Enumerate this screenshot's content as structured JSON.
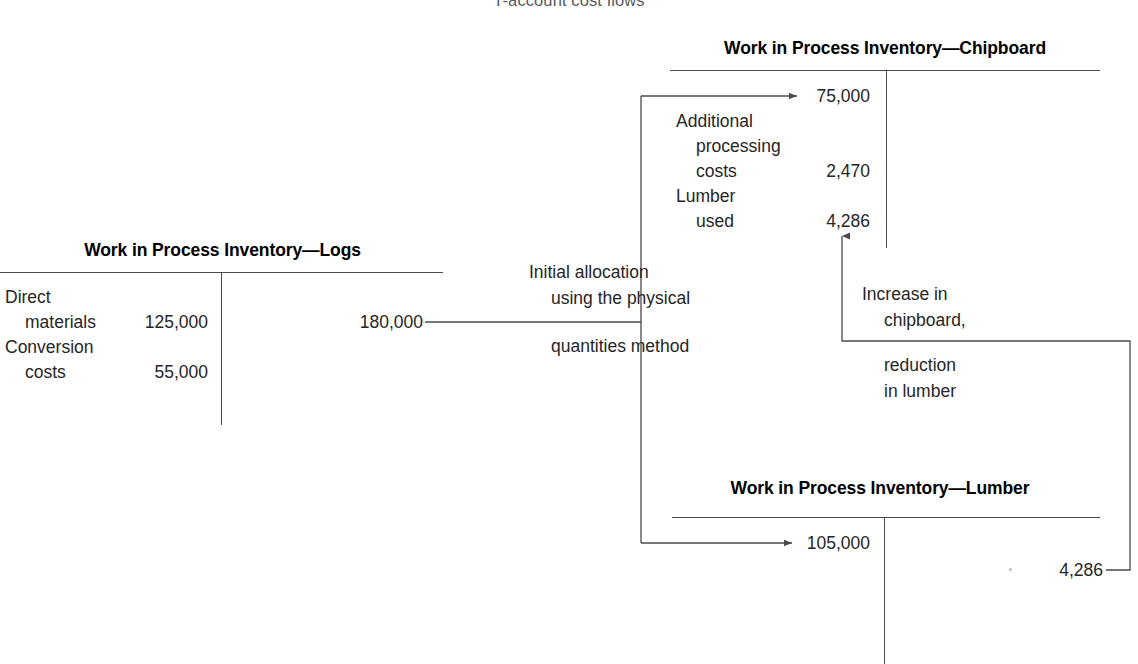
{
  "figure": {
    "title": "T-account cost flows"
  },
  "accounts": {
    "logs": {
      "title": "Work in Process Inventory—Logs",
      "debits": [
        {
          "label_line1": "Direct",
          "label_line2": "materials",
          "amount": "125,000"
        },
        {
          "label_line1": "Conversion",
          "label_line2": "costs",
          "amount": "55,000"
        }
      ],
      "credits": [
        {
          "amount": "180,000"
        }
      ]
    },
    "chipboard": {
      "title": "Work in Process Inventory—Chipboard",
      "debits": [
        {
          "label_line1": "",
          "label_line2": "",
          "amount": "75,000"
        },
        {
          "label_line1": "Additional",
          "label_line2": "processing",
          "label_line3": "costs",
          "amount": "2,470"
        },
        {
          "label_line1": "Lumber",
          "label_line2": "used",
          "amount": "4,286"
        }
      ],
      "credits": []
    },
    "lumber": {
      "title": "Work in Process Inventory—Lumber",
      "debits": [
        {
          "amount": "105,000"
        }
      ],
      "credits": [
        {
          "amount": "4,286"
        }
      ]
    }
  },
  "flows": {
    "initial_allocation": {
      "line1": "Initial allocation",
      "line2": "using the physical",
      "line3": "quantities method"
    },
    "swap": {
      "line1": "Increase in",
      "line2": "chipboard,",
      "line3": "reduction",
      "line4": "in lumber"
    }
  },
  "colors": {
    "ink": "#262626",
    "rule": "#4a4a4a",
    "title": "#555a5e"
  }
}
